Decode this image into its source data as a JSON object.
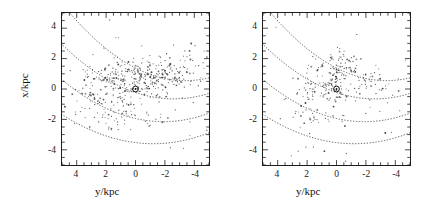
{
  "figure": {
    "kind": "two-panel-scatter",
    "background": "#ffffff",
    "ink_color": "#1c1c1c",
    "point_color": "#3b3b3b",
    "curve_color": "#555555"
  },
  "axes": {
    "x_tick_labels": [
      "4",
      "2",
      "0",
      "-2",
      "-4"
    ],
    "y_tick_labels": [
      "4",
      "2",
      "0",
      "-2",
      "-4"
    ],
    "x_title": "y/kpc",
    "y_title": "x/kpc",
    "x_range": [
      5,
      -5
    ],
    "y_range": [
      -5,
      5
    ],
    "x_reversed": true,
    "minor_ticks_per_major": 4
  },
  "panels": [
    {
      "id": "left",
      "name": "left-panel",
      "show_y_title": true,
      "show_y_ticklabels": true,
      "sun_marker": {
        "x": 0,
        "y": 0,
        "symbol": "sun-circle-dot"
      }
    },
    {
      "id": "right",
      "name": "right-panel",
      "show_y_title": false,
      "show_y_ticklabels": true,
      "sun_marker": {
        "x": 0,
        "y": 0,
        "symbol": "sun-circle-dot"
      }
    }
  ],
  "chart_data": {
    "type": "scatter",
    "title": "",
    "xlabel": "y/kpc",
    "ylabel": "x/kpc",
    "xlim": [
      5,
      -5
    ],
    "ylim": [
      -5,
      5
    ],
    "grid": false,
    "legend": null,
    "x_axis_inverted": true,
    "annotations": [
      {
        "label": "Sun",
        "symbol": "circled-dot",
        "x": 0,
        "y": 0,
        "panels": [
          "left",
          "right"
        ]
      }
    ],
    "spiral_arms": {
      "description": "four dotted parabolic spiral-arm traces, identical in both panels",
      "form": "x = a*(y - y0)^2 + x0",
      "curves": [
        {
          "name": "arm-1-outer-upper",
          "a": 0.072,
          "y0": -3.4,
          "x0": 0.55
        },
        {
          "name": "arm-2-upper",
          "a": 0.062,
          "y0": -2.6,
          "x0": -0.65
        },
        {
          "name": "arm-3-lower",
          "a": 0.058,
          "y0": -1.9,
          "x0": -2.15
        },
        {
          "name": "arm-4-lowest",
          "a": 0.05,
          "y0": -1.2,
          "x0": -3.6
        }
      ]
    },
    "series": [
      {
        "name": "left-panel-sources",
        "panel": "left",
        "n_points": 480,
        "marker": "dot",
        "note": "dense, elongated concentration tracing the inner two arms; heaviest near (0.6,0.7)",
        "clusters": [
          {
            "cx": 0.6,
            "cy": 0.7,
            "sx": 1.5,
            "sy": 0.55,
            "n": 150
          },
          {
            "cx": -1.6,
            "cy": 0.8,
            "sx": 1.5,
            "sy": 0.6,
            "n": 95
          },
          {
            "cx": 1.9,
            "cy": -0.2,
            "sx": 1.1,
            "sy": 0.8,
            "n": 70
          },
          {
            "cx": 1.4,
            "cy": -1.7,
            "sx": 1.3,
            "sy": 0.7,
            "n": 60
          },
          {
            "cx": -2.6,
            "cy": 1.2,
            "sx": 1.3,
            "sy": 0.9,
            "n": 45
          },
          {
            "cx": 0.0,
            "cy": -0.4,
            "sx": 2.6,
            "sy": 1.9,
            "n": 60
          }
        ]
      },
      {
        "name": "right-panel-sources",
        "panel": "right",
        "n_points": 290,
        "marker": "dot",
        "note": "sparser and clumpier than left panel; knots above centre and at y~1.5",
        "clusters": [
          {
            "cx": -0.2,
            "cy": 1.5,
            "sx": 0.75,
            "sy": 0.5,
            "n": 70
          },
          {
            "cx": 0.2,
            "cy": 0.0,
            "sx": 0.8,
            "sy": 0.45,
            "n": 55
          },
          {
            "cx": -1.9,
            "cy": 0.6,
            "sx": 1.3,
            "sy": 0.5,
            "n": 50
          },
          {
            "cx": 1.6,
            "cy": -1.6,
            "sx": 0.7,
            "sy": 0.55,
            "n": 35
          },
          {
            "cx": 1.5,
            "cy": 0.1,
            "sx": 0.9,
            "sy": 0.5,
            "n": 30
          },
          {
            "cx": 0.0,
            "cy": -0.8,
            "sx": 2.6,
            "sy": 2.0,
            "n": 50
          }
        ]
      }
    ]
  }
}
